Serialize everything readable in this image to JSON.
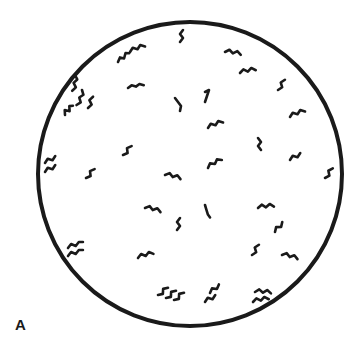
{
  "figure": {
    "panel_label": "A",
    "colors": {
      "background": "#ffffff",
      "ink": "#1a1a1a"
    },
    "field": {
      "cx": 190,
      "cy": 174,
      "r": 152
    },
    "organisms": [
      [
        183,
        30,
        "0,0 -3,4 0,8 -3,12",
        0
      ],
      [
        130,
        52,
        "0,0 4,-3 8,0 12,-3 16,0",
        -20
      ],
      [
        118,
        62,
        "0,0 4,-3 7,0 11,-4 14,-2",
        -30
      ],
      [
        225,
        52,
        "0,0 4,-3 8,0 12,-3 16,0",
        10
      ],
      [
        240,
        73,
        "0,0 4,-3 8,0 12,-3 16,0",
        -10
      ],
      [
        128,
        88,
        "0,0 4,-2 8,0 12,-2 16,0",
        -10
      ],
      [
        75,
        75,
        "0,0 3,4 0,8 3,12 0,16",
        10
      ],
      [
        82,
        90,
        "0,0 3,4 0,8 3,12 0,16",
        20
      ],
      [
        65,
        115,
        "0,0 3,-4 6,0 9,-4 12,-2",
        -40
      ],
      [
        88,
        108,
        "0,0 3,-4 0,-8 3,-12",
        10
      ],
      [
        175,
        98,
        "0,0 3,4 6,8 5,13",
        0
      ],
      [
        205,
        92,
        "0,0 4,-2 2,4 0,10",
        0
      ],
      [
        278,
        90,
        "0,0 3,-4 0,-8 3,-12",
        20
      ],
      [
        290,
        117,
        "0,0 4,-3 8,0 12,-3 16,0",
        -20
      ],
      [
        208,
        128,
        "0,0 4,-3 8,0 12,-3 16,0",
        -20
      ],
      [
        258,
        138,
        "0,0 3,4 0,8 3,12",
        0
      ],
      [
        123,
        155,
        "0,0 3,-4 0,-8 3,-12",
        30
      ],
      [
        45,
        163,
        "0,0 4,-3 8,0 12,-3",
        -20
      ],
      [
        45,
        172,
        "0,0 4,-3 8,0 12,-3",
        -20
      ],
      [
        86,
        178,
        "0,0 3,-4 0,-8 3,-12",
        30
      ],
      [
        165,
        175,
        "0,0 4,-3 8,0 12,-3 16,0",
        15
      ],
      [
        208,
        168,
        "0,0 4,-3 8,0 12,-3 16,0",
        -30
      ],
      [
        290,
        160,
        "0,0 4,-3 8,0 12,-3",
        -20
      ],
      [
        325,
        178,
        "0,0 3,-4 0,-8 3,-12",
        25
      ],
      [
        145,
        208,
        "0,0 4,-3 8,0 12,-3 16,0",
        15
      ],
      [
        205,
        205,
        "0,0 3,4 6,8 9,10",
        20
      ],
      [
        180,
        218,
        "0,0 -3,4 0,8 -3,12",
        0
      ],
      [
        258,
        208,
        "0,0 4,-3 8,0 12,-3 16,0",
        -5
      ],
      [
        275,
        232,
        "0,0 4,-3 8,0 12,-3",
        -40
      ],
      [
        68,
        248,
        "0,0 4,-3 8,0 12,-3 16,-2",
        -15
      ],
      [
        68,
        256,
        "0,0 4,-3 8,0 12,-3 16,-2",
        -15
      ],
      [
        138,
        258,
        "0,0 4,-3 8,0 12,-3 16,0",
        -15
      ],
      [
        252,
        255,
        "0,0 3,-4 0,-8 3,-12",
        20
      ],
      [
        282,
        255,
        "0,0 4,-3 8,0 12,-3 16,0",
        15
      ],
      [
        158,
        295,
        "0,0 3,-4 0,-8 3,-12",
        40
      ],
      [
        166,
        298,
        "0,0 3,-4 0,-8 3,-12",
        40
      ],
      [
        174,
        300,
        "0,0 3,-4 0,-8 3,-12",
        40
      ],
      [
        210,
        293,
        "0,0 4,-3 8,0 12,-3",
        -30
      ],
      [
        205,
        302,
        "0,0 4,-3 8,0 12,-3",
        -20
      ],
      [
        255,
        292,
        "0,0 4,-3 8,0 12,-3 16,0",
        5
      ],
      [
        253,
        302,
        "0,0 4,-3 8,0 12,-3 16,0",
        -10
      ]
    ]
  }
}
